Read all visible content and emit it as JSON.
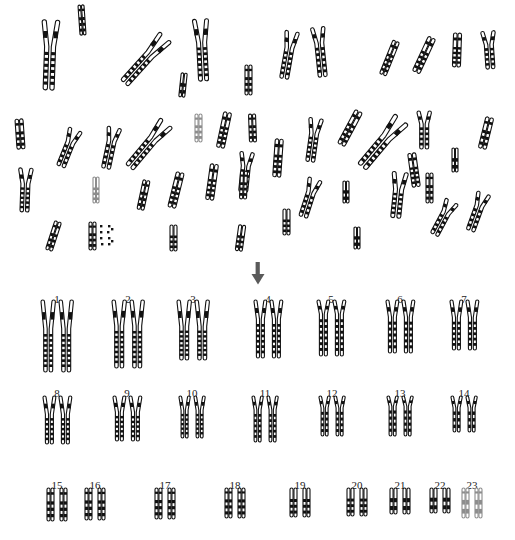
{
  "figure": {
    "background_color": "#ffffff",
    "ink_color": "#111111",
    "pale_ink_color": "#8d8d8d",
    "arrow_color": "#5a5a5a"
  },
  "annotations": {
    "arrow": {
      "name": "down-arrow-marker",
      "points_to_label": "4",
      "x": 258,
      "y": 262,
      "color": "#5a5a5a"
    }
  },
  "karyotype": {
    "rows": [
      {
        "row_index": 1,
        "label_y": 294,
        "chrom_y": 300,
        "pairs": [
          {
            "label": "1",
            "cx": 57,
            "height": 72,
            "arm_ratio": 0.4,
            "bands": 7,
            "width": 9
          },
          {
            "label": "2",
            "cx": 128,
            "height": 68,
            "arm_ratio": 0.38,
            "bands": 7,
            "width": 9
          },
          {
            "label": "3",
            "cx": 193,
            "height": 60,
            "arm_ratio": 0.44,
            "bands": 6,
            "width": 9
          },
          {
            "label": "4",
            "cx": 268,
            "height": 58,
            "arm_ratio": 0.33,
            "bands": 6,
            "width": 8
          },
          {
            "label": "5",
            "cx": 331,
            "height": 56,
            "arm_ratio": 0.25,
            "bands": 6,
            "width": 8
          },
          {
            "label": "6",
            "cx": 400,
            "height": 53,
            "arm_ratio": 0.32,
            "bands": 5,
            "width": 8
          },
          {
            "label": "7",
            "cx": 464,
            "height": 50,
            "arm_ratio": 0.35,
            "bands": 5,
            "width": 8
          }
        ]
      },
      {
        "row_index": 2,
        "label_y": 388,
        "chrom_y": 396,
        "pairs": [
          {
            "label": "8",
            "cx": 57,
            "height": 48,
            "arm_ratio": 0.38,
            "bands": 5,
            "width": 8
          },
          {
            "label": "9",
            "cx": 127,
            "height": 45,
            "arm_ratio": 0.36,
            "bands": 5,
            "width": 8
          },
          {
            "label": "10",
            "cx": 192,
            "height": 42,
            "arm_ratio": 0.34,
            "bands": 5,
            "width": 7
          },
          {
            "label": "11",
            "cx": 265,
            "height": 46,
            "arm_ratio": 0.3,
            "bands": 5,
            "width": 7
          },
          {
            "label": "12",
            "cx": 332,
            "height": 40,
            "arm_ratio": 0.3,
            "bands": 4,
            "width": 7
          },
          {
            "label": "13",
            "cx": 400,
            "height": 40,
            "arm_ratio": 0.26,
            "bands": 4,
            "width": 7
          },
          {
            "label": "14",
            "cx": 464,
            "height": 36,
            "arm_ratio": 0.33,
            "bands": 3,
            "width": 7
          }
        ]
      },
      {
        "row_index": 3,
        "label_y": 480,
        "chrom_y": 488,
        "pairs": [
          {
            "label": "15",
            "cx": 57,
            "height": 33,
            "arm_ratio": 0.3,
            "bands": 3,
            "width": 7
          },
          {
            "label": "16",
            "cx": 95,
            "height": 32,
            "arm_ratio": 0.28,
            "bands": 3,
            "width": 7
          },
          {
            "label": "17",
            "cx": 165,
            "height": 31,
            "arm_ratio": 0.28,
            "bands": 3,
            "width": 7
          },
          {
            "label": "18",
            "cx": 235,
            "height": 30,
            "arm_ratio": 0.27,
            "bands": 3,
            "width": 7
          },
          {
            "label": "19",
            "cx": 300,
            "height": 29,
            "arm_ratio": 0.27,
            "bands": 3,
            "width": 7
          },
          {
            "label": "20",
            "cx": 357,
            "height": 28,
            "arm_ratio": 0.27,
            "bands": 3,
            "width": 7
          },
          {
            "label": "21",
            "cx": 400,
            "height": 26,
            "arm_ratio": 0.26,
            "bands": 2,
            "width": 7
          },
          {
            "label": "22",
            "cx": 440,
            "height": 25,
            "arm_ratio": 0.26,
            "bands": 2,
            "width": 7
          },
          {
            "label": "23",
            "cx": 472,
            "height": 30,
            "arm_ratio": 0.27,
            "bands": 2,
            "width": 7,
            "pale": true
          }
        ]
      }
    ]
  },
  "spread": {
    "count": 46,
    "chromosomes": [
      {
        "id": 1,
        "x": 50,
        "y": 55,
        "len": 70,
        "w": 11,
        "rot": 2,
        "arm": 0.38,
        "bands": 6,
        "open": true
      },
      {
        "id": 2,
        "x": 82,
        "y": 20,
        "len": 30,
        "w": 6,
        "rot": -4,
        "arm": 0.3,
        "bands": 3
      },
      {
        "id": 3,
        "x": 145,
        "y": 60,
        "len": 62,
        "w": 10,
        "rot": 42,
        "arm": 0.38,
        "bands": 6,
        "open": true
      },
      {
        "id": 4,
        "x": 202,
        "y": 50,
        "len": 62,
        "w": 10,
        "rot": -3,
        "arm": 0.38,
        "bands": 6,
        "open": true
      },
      {
        "id": 5,
        "x": 183,
        "y": 85,
        "len": 24,
        "w": 6,
        "rot": 6,
        "arm": 0.3,
        "bands": 2
      },
      {
        "id": 6,
        "x": 248,
        "y": 80,
        "len": 30,
        "w": 7,
        "rot": 0,
        "arm": 0.3,
        "bands": 3
      },
      {
        "id": 7,
        "x": 288,
        "y": 55,
        "len": 48,
        "w": 9,
        "rot": 10,
        "arm": 0.35,
        "bands": 5,
        "open": true
      },
      {
        "id": 8,
        "x": 320,
        "y": 52,
        "len": 50,
        "w": 9,
        "rot": -6,
        "arm": 0.32,
        "bands": 5,
        "open": true
      },
      {
        "id": 9,
        "x": 389,
        "y": 58,
        "len": 36,
        "w": 7,
        "rot": 22,
        "arm": 0.3,
        "bands": 4
      },
      {
        "id": 10,
        "x": 424,
        "y": 55,
        "len": 38,
        "w": 8,
        "rot": 25,
        "arm": 0.32,
        "bands": 4
      },
      {
        "id": 11,
        "x": 457,
        "y": 50,
        "len": 34,
        "w": 8,
        "rot": 2,
        "arm": 0.32,
        "bands": 4
      },
      {
        "id": 12,
        "x": 489,
        "y": 50,
        "len": 38,
        "w": 9,
        "rot": -4,
        "arm": 0.36,
        "bands": 4,
        "open": true
      },
      {
        "id": 13,
        "x": 20,
        "y": 134,
        "len": 30,
        "w": 8,
        "rot": -4,
        "arm": 0.32,
        "bands": 3
      },
      {
        "id": 14,
        "x": 68,
        "y": 148,
        "len": 40,
        "w": 9,
        "rot": 22,
        "arm": 0.35,
        "bands": 4,
        "open": true
      },
      {
        "id": 15,
        "x": 110,
        "y": 148,
        "len": 42,
        "w": 9,
        "rot": 12,
        "arm": 0.33,
        "bands": 4,
        "open": true
      },
      {
        "id": 16,
        "x": 148,
        "y": 145,
        "len": 58,
        "w": 10,
        "rot": 40,
        "arm": 0.36,
        "bands": 6,
        "open": true
      },
      {
        "id": 17,
        "x": 198,
        "y": 128,
        "len": 28,
        "w": 7,
        "rot": 0,
        "arm": 0.3,
        "bands": 3,
        "pale": true
      },
      {
        "id": 18,
        "x": 224,
        "y": 130,
        "len": 36,
        "w": 8,
        "rot": 12,
        "arm": 0.32,
        "bands": 4
      },
      {
        "id": 19,
        "x": 252,
        "y": 128,
        "len": 28,
        "w": 7,
        "rot": -2,
        "arm": 0.3,
        "bands": 3
      },
      {
        "id": 20,
        "x": 245,
        "y": 172,
        "len": 40,
        "w": 9,
        "rot": 6,
        "arm": 0.35,
        "bands": 4,
        "open": true
      },
      {
        "id": 21,
        "x": 278,
        "y": 158,
        "len": 38,
        "w": 8,
        "rot": 4,
        "arm": 0.32,
        "bands": 4
      },
      {
        "id": 22,
        "x": 313,
        "y": 140,
        "len": 44,
        "w": 9,
        "rot": 8,
        "arm": 0.35,
        "bands": 5,
        "open": true
      },
      {
        "id": 23,
        "x": 350,
        "y": 128,
        "len": 38,
        "w": 8,
        "rot": 28,
        "arm": 0.3,
        "bands": 4
      },
      {
        "id": 24,
        "x": 382,
        "y": 143,
        "len": 62,
        "w": 11,
        "rot": 40,
        "arm": 0.38,
        "bands": 6,
        "open": true
      },
      {
        "id": 25,
        "x": 424,
        "y": 130,
        "len": 38,
        "w": 9,
        "rot": 0,
        "arm": 0.34,
        "bands": 4,
        "open": true
      },
      {
        "id": 26,
        "x": 455,
        "y": 160,
        "len": 24,
        "w": 6,
        "rot": 0,
        "arm": 0.3,
        "bands": 2
      },
      {
        "id": 27,
        "x": 486,
        "y": 133,
        "len": 32,
        "w": 8,
        "rot": 14,
        "arm": 0.32,
        "bands": 3
      },
      {
        "id": 28,
        "x": 25,
        "y": 190,
        "len": 44,
        "w": 9,
        "rot": 2,
        "arm": 0.36,
        "bands": 5,
        "open": true
      },
      {
        "id": 29,
        "x": 96,
        "y": 190,
        "len": 26,
        "w": 6,
        "rot": 0,
        "arm": 0.3,
        "bands": 3,
        "pale": true
      },
      {
        "id": 30,
        "x": 143,
        "y": 195,
        "len": 30,
        "w": 7,
        "rot": 12,
        "arm": 0.3,
        "bands": 3
      },
      {
        "id": 31,
        "x": 176,
        "y": 190,
        "len": 36,
        "w": 8,
        "rot": 14,
        "arm": 0.32,
        "bands": 4
      },
      {
        "id": 32,
        "x": 212,
        "y": 182,
        "len": 36,
        "w": 8,
        "rot": 8,
        "arm": 0.33,
        "bands": 4
      },
      {
        "id": 33,
        "x": 243,
        "y": 185,
        "len": 28,
        "w": 7,
        "rot": 2,
        "arm": 0.3,
        "bands": 3
      },
      {
        "id": 34,
        "x": 309,
        "y": 198,
        "len": 40,
        "w": 9,
        "rot": 18,
        "arm": 0.35,
        "bands": 4,
        "open": true
      },
      {
        "id": 35,
        "x": 346,
        "y": 192,
        "len": 22,
        "w": 6,
        "rot": 0,
        "arm": 0.3,
        "bands": 2
      },
      {
        "id": 36,
        "x": 398,
        "y": 195,
        "len": 46,
        "w": 10,
        "rot": 6,
        "arm": 0.38,
        "bands": 5,
        "open": true
      },
      {
        "id": 37,
        "x": 429,
        "y": 188,
        "len": 30,
        "w": 7,
        "rot": 0,
        "arm": 0.3,
        "bands": 3
      },
      {
        "id": 38,
        "x": 443,
        "y": 218,
        "len": 38,
        "w": 9,
        "rot": 28,
        "arm": 0.34,
        "bands": 4,
        "open": true
      },
      {
        "id": 39,
        "x": 477,
        "y": 212,
        "len": 40,
        "w": 9,
        "rot": 20,
        "arm": 0.34,
        "bands": 4,
        "open": true
      },
      {
        "id": 40,
        "x": 53,
        "y": 236,
        "len": 30,
        "w": 7,
        "rot": 18,
        "arm": 0.32,
        "bands": 3
      },
      {
        "id": 41,
        "x": 92,
        "y": 236,
        "len": 28,
        "w": 7,
        "rot": 0,
        "arm": 0.3,
        "bands": 3,
        "specks": true
      },
      {
        "id": 42,
        "x": 173,
        "y": 238,
        "len": 26,
        "w": 7,
        "rot": 0,
        "arm": 0.3,
        "bands": 3
      },
      {
        "id": 43,
        "x": 240,
        "y": 238,
        "len": 26,
        "w": 7,
        "rot": 8,
        "arm": 0.3,
        "bands": 3
      },
      {
        "id": 44,
        "x": 286,
        "y": 222,
        "len": 26,
        "w": 7,
        "rot": 0,
        "arm": 0.3,
        "bands": 3
      },
      {
        "id": 45,
        "x": 357,
        "y": 238,
        "len": 22,
        "w": 6,
        "rot": 0,
        "arm": 0.3,
        "bands": 2
      },
      {
        "id": 46,
        "x": 414,
        "y": 170,
        "len": 34,
        "w": 8,
        "rot": -8,
        "arm": 0.32,
        "bands": 4
      }
    ]
  }
}
